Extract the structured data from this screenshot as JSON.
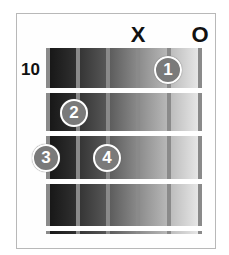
{
  "chord_diagram": {
    "start_fret_label": "10",
    "string_markers": [
      {
        "string": 4,
        "label": "X",
        "meaning": "muted"
      },
      {
        "string": 6,
        "label": "O",
        "meaning": "open"
      }
    ],
    "fingers": [
      {
        "label": "1",
        "string": 5,
        "fret": 1
      },
      {
        "label": "2",
        "string": 2,
        "fret": 2
      },
      {
        "label": "3",
        "string": 1,
        "fret": 3
      },
      {
        "label": "4",
        "string": 3,
        "fret": 3
      }
    ],
    "string_count": 6,
    "fret_count": 4,
    "colors": {
      "border": "#b8b8b8",
      "string": "#8a8a8a",
      "fret": "#ffffff",
      "dot": "#7a7a7a",
      "board_dark": "#141414",
      "board_light": "#ececec"
    }
  }
}
